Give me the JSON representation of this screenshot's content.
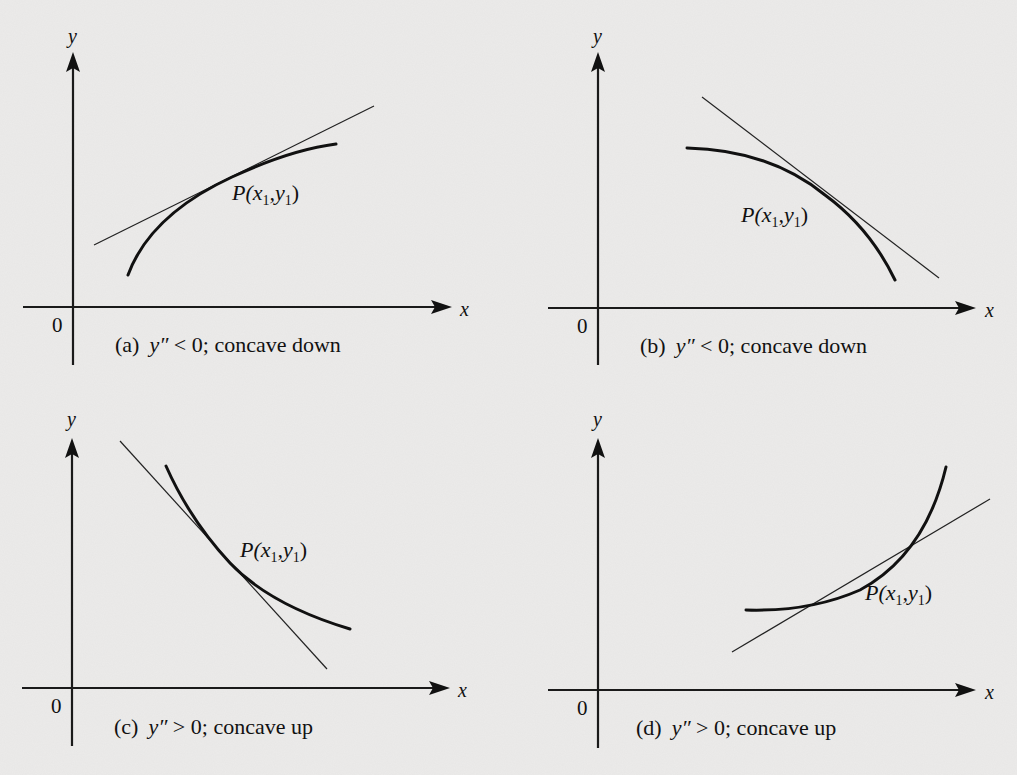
{
  "figure": {
    "panels": [
      {
        "id": "a",
        "caption_tag": "(a)",
        "caption_expr": "y″",
        "caption_rest": " < 0; concave down",
        "point_label": {
          "P": "P(x",
          "sub1": "1",
          "mid": ",y",
          "sub2": "1",
          "end": ")"
        },
        "x_axis_label": "x",
        "y_axis_label": "y",
        "origin_label": "0",
        "concavity": "down",
        "second_derivative_sign": "< 0"
      },
      {
        "id": "b",
        "caption_tag": "(b)",
        "caption_expr": "y″",
        "caption_rest": " < 0; concave down",
        "point_label": {
          "P": "P(x",
          "sub1": "1",
          "mid": ",y",
          "sub2": "1",
          "end": ")"
        },
        "x_axis_label": "x",
        "y_axis_label": "y",
        "origin_label": "0",
        "concavity": "down",
        "second_derivative_sign": "< 0"
      },
      {
        "id": "c",
        "caption_tag": "(c)",
        "caption_expr": "y″",
        "caption_rest": " > 0; concave up",
        "point_label": {
          "P": "P(x",
          "sub1": "1",
          "mid": ",y",
          "sub2": "1",
          "end": ")"
        },
        "x_axis_label": "x",
        "y_axis_label": "y",
        "origin_label": "0",
        "concavity": "up",
        "second_derivative_sign": "> 0"
      },
      {
        "id": "d",
        "caption_tag": "(d)",
        "caption_expr": "y″",
        "caption_rest": " > 0; concave up",
        "point_label": {
          "P": "P(x",
          "sub1": "1",
          "mid": ",y",
          "sub2": "1",
          "end": ")"
        },
        "x_axis_label": "x",
        "y_axis_label": "y",
        "origin_label": "0",
        "concavity": "up",
        "second_derivative_sign": "> 0"
      }
    ]
  }
}
